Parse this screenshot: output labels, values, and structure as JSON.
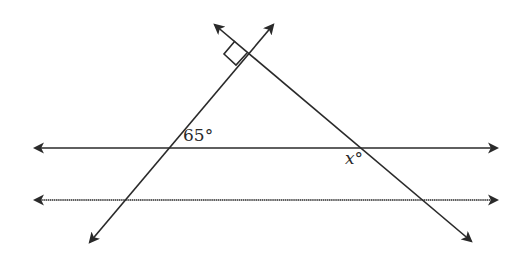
{
  "diagram": {
    "type": "geometry",
    "stroke_color": "#2a2a2a",
    "labels": {
      "angle_65": "65°",
      "angle_x": "x°"
    },
    "right_angle_marker": true,
    "parallel_lines": 2,
    "transversals": 2
  }
}
